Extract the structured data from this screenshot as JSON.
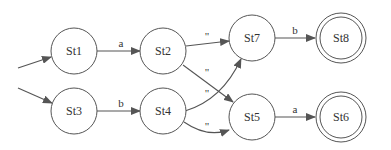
{
  "diagram": {
    "type": "state-machine",
    "nodes": [
      {
        "id": "St1",
        "label": "St1",
        "accepting": false,
        "initial": true
      },
      {
        "id": "St2",
        "label": "St2",
        "accepting": false
      },
      {
        "id": "St3",
        "label": "St3",
        "accepting": false,
        "initial": true
      },
      {
        "id": "St4",
        "label": "St4",
        "accepting": false
      },
      {
        "id": "St7",
        "label": "St7",
        "accepting": false
      },
      {
        "id": "St5",
        "label": "St5",
        "accepting": false
      },
      {
        "id": "St8",
        "label": "St8",
        "accepting": true
      },
      {
        "id": "St6",
        "label": "St6",
        "accepting": true
      }
    ],
    "edges": [
      {
        "from": "start",
        "to": "St1",
        "label": ""
      },
      {
        "from": "start",
        "to": "St3",
        "label": ""
      },
      {
        "from": "St1",
        "to": "St2",
        "label": "a"
      },
      {
        "from": "St3",
        "to": "St4",
        "label": "b"
      },
      {
        "from": "St2",
        "to": "St7",
        "label": "\""
      },
      {
        "from": "St2",
        "to": "St5",
        "label": "\""
      },
      {
        "from": "St4",
        "to": "St7",
        "label": "\""
      },
      {
        "from": "St4",
        "to": "St5",
        "label": "\""
      },
      {
        "from": "St7",
        "to": "St8",
        "label": "b"
      },
      {
        "from": "St5",
        "to": "St6",
        "label": "a"
      }
    ]
  }
}
